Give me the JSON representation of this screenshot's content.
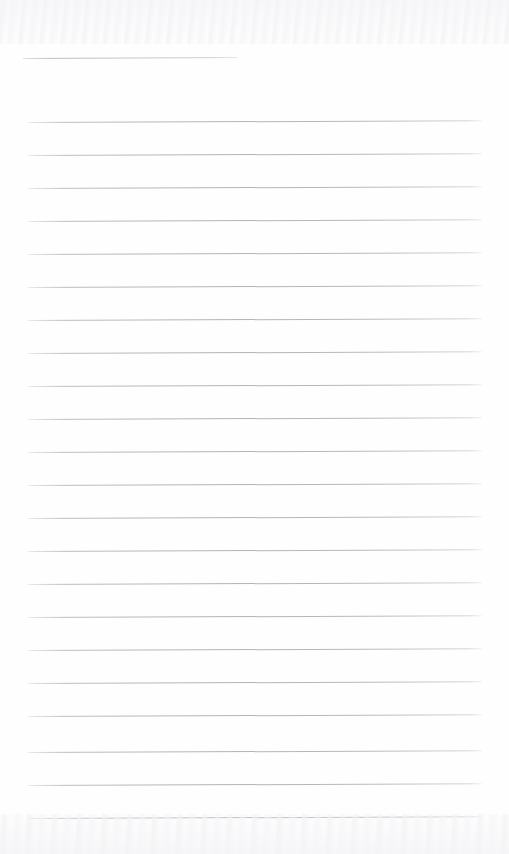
{
  "page": {
    "kind": "scanned-lined-notebook-page",
    "width": 509,
    "height": 854,
    "background_color": "#fefefe",
    "rule_color": "#b6b6bd",
    "text_content": "",
    "visible_text": []
  },
  "header_rule": {
    "name": "header-rule",
    "x": 23,
    "y": 58,
    "width": 215,
    "slant_deg": -0.25,
    "color": "#bcbcc2"
  },
  "body_rules": {
    "start_x": 28,
    "end_x": 482,
    "width": 454,
    "first_y": 122,
    "spacing": 33,
    "count": 22,
    "slant_deg": -0.22,
    "color": "#b6b6bd",
    "lines": [
      {
        "index": 1,
        "y": 122
      },
      {
        "index": 2,
        "y": 155
      },
      {
        "index": 3,
        "y": 188
      },
      {
        "index": 4,
        "y": 221
      },
      {
        "index": 5,
        "y": 254
      },
      {
        "index": 6,
        "y": 287
      },
      {
        "index": 7,
        "y": 320
      },
      {
        "index": 8,
        "y": 353
      },
      {
        "index": 9,
        "y": 386
      },
      {
        "index": 10,
        "y": 419
      },
      {
        "index": 11,
        "y": 452
      },
      {
        "index": 12,
        "y": 485
      },
      {
        "index": 13,
        "y": 518
      },
      {
        "index": 14,
        "y": 551
      },
      {
        "index": 15,
        "y": 584
      },
      {
        "index": 16,
        "y": 617
      },
      {
        "index": 17,
        "y": 650
      },
      {
        "index": 18,
        "y": 683
      },
      {
        "index": 19,
        "y": 716
      },
      {
        "index": 20,
        "y": 752
      },
      {
        "index": 21,
        "y": 785
      },
      {
        "index": 22,
        "y": 818
      }
    ]
  },
  "scan_artifacts": {
    "top_band_height": 44,
    "bottom_band_height": 40,
    "color": "#f5f5f7"
  }
}
